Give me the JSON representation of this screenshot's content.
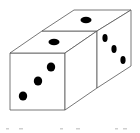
{
  "figure": {
    "stroke_color": "#555555",
    "pip_color": "#000000",
    "background": "#ffffff"
  },
  "dice": [
    {
      "name": "front-die",
      "faces": {
        "front": {
          "pips": 3
        },
        "top": {
          "pips": 1
        }
      }
    },
    {
      "name": "back-die",
      "faces": {
        "top": {
          "pips": 1
        },
        "right": {
          "pips": 3
        }
      }
    }
  ],
  "caption": {
    "fragments": [
      "",
      "",
      ""
    ]
  }
}
